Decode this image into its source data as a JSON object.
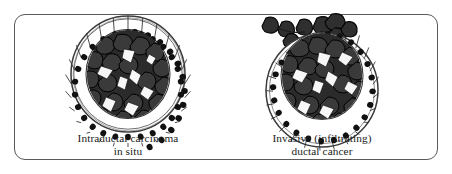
{
  "figure": {
    "background_color": "#ffffff",
    "frame": {
      "shape": "rounded-rectangle",
      "border_color": "#5a5a5a",
      "corner_radius_px": 11
    }
  },
  "panels": [
    {
      "id": "intraductal",
      "caption_line1": "Intraductal carcinoma",
      "caption_line2": "in situ",
      "structure": {
        "duct_wall": "intact",
        "epithelial_cells_count": 24,
        "tumor_fill": "confined within duct lumen",
        "invasion": "none"
      }
    },
    {
      "id": "invasive",
      "caption_line1": "Invasive (infiltrating)",
      "caption_line2": "ductal cancer",
      "structure": {
        "duct_wall": "breached at upper margin",
        "epithelial_cells_count": 24,
        "tumor_fill": "fills duct lumen and extends beyond wall",
        "invasion": "tumor cells escaping upward and to the left"
      }
    }
  ],
  "colors": {
    "tumor_cell_fill": "#2b2b2b",
    "tumor_cell_outline": "#000000",
    "epithelial_cell_fill": "#ffffff",
    "nucleus_fill": "#111111",
    "duct_wall_line": "#3a3a3a",
    "lumen_gap_fill": "#f7f7f7",
    "caption_text": "#1b1b1b"
  }
}
